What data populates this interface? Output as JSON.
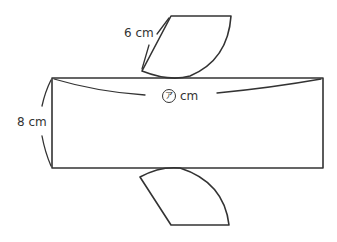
{
  "figure": {
    "type": "net-of-cylinder-part",
    "labels": {
      "slant_length": "6 cm",
      "height": "8 cm",
      "length_symbol": "ア",
      "length_unit": "cm"
    },
    "colors": {
      "stroke": "#333333",
      "background": "#ffffff"
    }
  }
}
